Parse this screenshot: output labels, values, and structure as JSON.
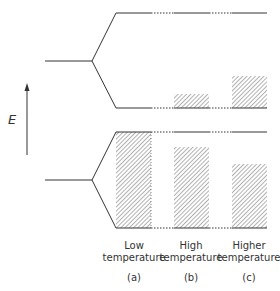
{
  "diagram": {
    "type": "energy-band-diagram",
    "axis": {
      "label": "E",
      "direction": "up"
    },
    "columns": [
      {
        "id": "a",
        "line1": "Low",
        "line2": "temperature",
        "tag": "(a)",
        "upper_fill_top": 108,
        "lower_fill_top": 132
      },
      {
        "id": "b",
        "line1": "High",
        "line2": "temperature",
        "tag": "(b)",
        "upper_fill_top": 94,
        "lower_fill_top": 147
      },
      {
        "id": "c",
        "line1": "Higher",
        "line2": "temperature",
        "tag": "(c)",
        "upper_fill_top": 76,
        "lower_fill_top": 164
      }
    ],
    "bands": {
      "upper": {
        "top_y": 13,
        "bottom_y": 108,
        "apex": {
          "x": 92,
          "y": 61
        }
      },
      "lower": {
        "top_y": 132,
        "bottom_y": 228,
        "apex": {
          "x": 92,
          "y": 180
        }
      }
    },
    "colors": {
      "line": "#333333",
      "hatch": "#555555"
    }
  }
}
